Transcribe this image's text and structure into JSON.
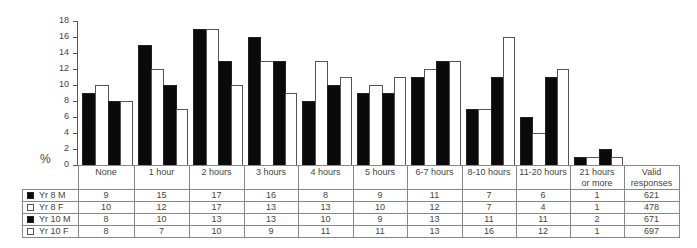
{
  "chart_data": {
    "type": "bar",
    "title": "",
    "xlabel": "",
    "ylabel": "%",
    "ylim": [
      0,
      18
    ],
    "yticks": [
      0,
      2,
      4,
      6,
      8,
      10,
      12,
      14,
      16,
      18
    ],
    "grid": false,
    "legend_position": "table-below",
    "categories": [
      "None",
      "1 hour",
      "2 hours",
      "3 hours",
      "4 hours",
      "5 hours",
      "6-7 hours",
      "8-10 hours",
      "11-20 hours",
      "21 hours or more"
    ],
    "series": [
      {
        "name": "Yr 8 M",
        "fill": "#0a0a0a",
        "values": [
          9,
          15,
          17,
          16,
          8,
          9,
          11,
          7,
          6,
          1
        ],
        "valid_responses": 621
      },
      {
        "name": "Yr 8 F",
        "fill": "#ffffff",
        "values": [
          10,
          12,
          17,
          13,
          13,
          10,
          12,
          7,
          4,
          1
        ],
        "valid_responses": 478
      },
      {
        "name": "Yr 10 M",
        "fill": "#0a0a0a",
        "values": [
          8,
          10,
          13,
          13,
          10,
          9,
          13,
          11,
          11,
          2
        ],
        "valid_responses": 671
      },
      {
        "name": "Yr 10 F",
        "fill": "#ffffff",
        "values": [
          8,
          7,
          10,
          9,
          11,
          11,
          13,
          16,
          12,
          1
        ],
        "valid_responses": 697
      }
    ]
  },
  "table": {
    "category_headers": [
      "None",
      "1 hour",
      "2 hours",
      "3 hours",
      "4 hours",
      "5 hours",
      "6-7 hours",
      "8-10 hours",
      "11-20 hours",
      "21 hours\nor more"
    ],
    "valid_header": "Valid responses",
    "valid_header_line1": "Valid",
    "valid_header_line2": "responses",
    "cat_21_line1": "21 hours",
    "cat_21_line2": "or more"
  },
  "axis": {
    "y_symbol": "%"
  }
}
